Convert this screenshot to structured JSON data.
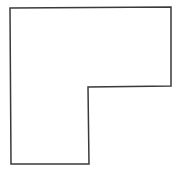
{
  "diagram": {
    "shape": "L-shaped polygon",
    "stroke_color": "#3a3a3a",
    "fill_color": "#ffffff",
    "stroke_width": 1.5,
    "vertices": [
      [
        10,
        8
      ],
      [
        171,
        7
      ],
      [
        171,
        86
      ],
      [
        88,
        87
      ],
      [
        89,
        164
      ],
      [
        11,
        164
      ]
    ]
  }
}
